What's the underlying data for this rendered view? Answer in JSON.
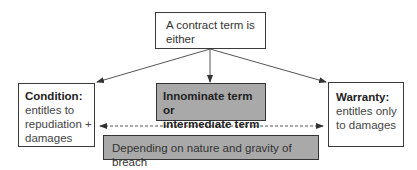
{
  "diagram": {
    "top": {
      "text": "A contract term is either"
    },
    "condition": {
      "title": "Condition:",
      "text_lines": [
        "entitles to",
        "repudiation +",
        "damages"
      ]
    },
    "innominate": {
      "text_lines": [
        "Innominate term or",
        "intermediate term"
      ]
    },
    "warranty": {
      "title": "Warranty:",
      "text_lines": [
        "entitles only",
        "to damages"
      ]
    },
    "breach": {
      "text": "Depending on nature and gravity of breach"
    },
    "colors": {
      "shaded_fill": "#a9a9a9",
      "border": "#3a3a3a",
      "arrow": "#444444"
    }
  }
}
